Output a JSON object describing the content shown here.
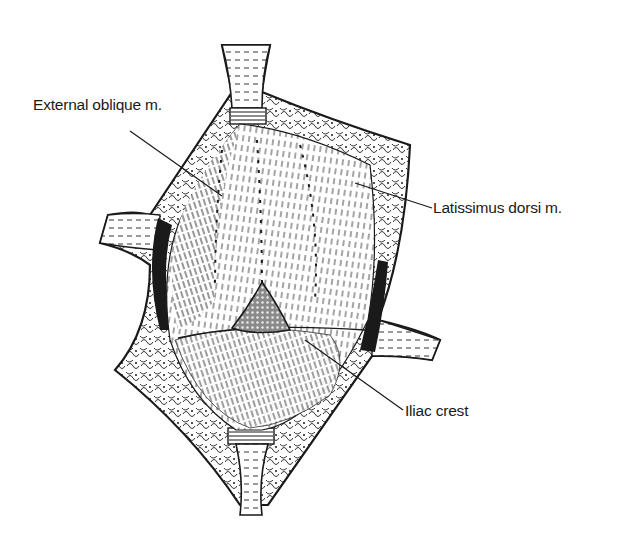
{
  "figure": {
    "colors": {
      "ink": "#1a1a1a",
      "background": "#ffffff",
      "mesh": "#6e6e6e"
    },
    "labels": [
      {
        "id": "external-oblique",
        "text": "External oblique m."
      },
      {
        "id": "latissimus-dorsi",
        "text": "Latissimus dorsi m."
      },
      {
        "id": "iliac-crest",
        "text": "Iliac crest"
      }
    ]
  }
}
